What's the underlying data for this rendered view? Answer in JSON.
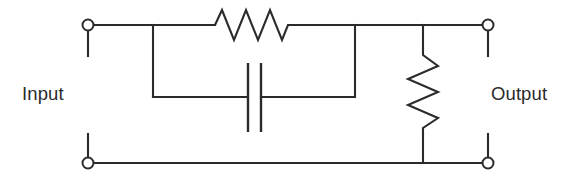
{
  "figure": {
    "kind": "circuit-schematic",
    "title": "",
    "background_color": "#ffffff",
    "line_color": "#2b2b2b",
    "width": 574,
    "height": 182
  },
  "labels": {
    "input": "Input",
    "output": "Output"
  },
  "terminals": [
    {
      "name": "input-top",
      "label": "Input",
      "cx": 88,
      "cy": 25,
      "r": 5.5
    },
    {
      "name": "input-bottom",
      "label": "Input",
      "cx": 88,
      "cy": 163,
      "r": 5.5
    },
    {
      "name": "output-top",
      "label": "Output",
      "cx": 488,
      "cy": 25,
      "r": 5.5
    },
    {
      "name": "output-bottom",
      "label": "Output",
      "cx": 488,
      "cy": 163,
      "r": 5.5
    }
  ],
  "components": [
    {
      "name": "series-resistor",
      "type": "resistor",
      "orientation": "horizontal",
      "value": "",
      "x_start": 215,
      "x_end": 292,
      "y_center": 25,
      "amplitude": 15,
      "peaks": 3
    },
    {
      "name": "series-capacitor",
      "type": "capacitor",
      "orientation": "vertical-plates",
      "value": "",
      "plate_left_x": 248,
      "plate_right_x": 261,
      "plate_top_y": 63,
      "plate_bottom_y": 132,
      "y_center": 97
    },
    {
      "name": "shunt-resistor",
      "type": "resistor",
      "orientation": "vertical",
      "value": "",
      "x_center": 423,
      "y_start": 48,
      "y_end": 135,
      "amplitude": 15,
      "peaks": 3
    }
  ],
  "nodes": {
    "left_branch_x": 153,
    "right_branch_x": 355,
    "top_rail_y": 25,
    "bottom_rail_y": 163,
    "cap_branch_y": 97,
    "stub_length": 24
  }
}
